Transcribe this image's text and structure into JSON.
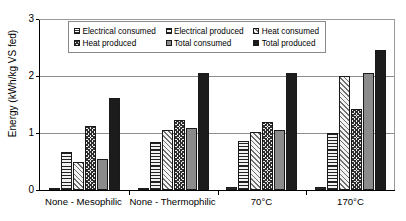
{
  "chart_data": {
    "type": "bar",
    "title": "",
    "xlabel": "",
    "ylabel": "Energy (kWh/kg VS fed)",
    "ylim": [
      0,
      3
    ],
    "yticks": [
      0,
      1,
      2,
      3
    ],
    "ytick_labels": [
      "0",
      "1",
      "2",
      "3"
    ],
    "grid": "horizontal",
    "legend_position": "top-center-inside",
    "categories": [
      "None - Mesophilic",
      "None - Thermophilic",
      "70°C",
      "170°C"
    ],
    "series": [
      {
        "name": "Electrical consumed",
        "fill": "cross-hatch-fine",
        "values": [
          0.04,
          0.04,
          0.05,
          0.06
        ]
      },
      {
        "name": "Electrical produced",
        "fill": "horizontal-lines",
        "values": [
          0.66,
          0.85,
          0.86,
          1.0
        ]
      },
      {
        "name": "Heat consumed",
        "fill": "diagonal-lines",
        "values": [
          0.5,
          1.05,
          1.01,
          2.0
        ]
      },
      {
        "name": "Heat produced",
        "fill": "dense-cross-hatch",
        "values": [
          1.12,
          1.22,
          1.2,
          1.43
        ]
      },
      {
        "name": "Total consumed",
        "fill": "solid-gray",
        "values": [
          0.54,
          1.09,
          1.06,
          2.06
        ]
      },
      {
        "name": "Total produced",
        "fill": "solid-black",
        "values": [
          1.62,
          2.05,
          2.05,
          2.46
        ]
      }
    ]
  },
  "colors": {
    "axis": "#000000",
    "gridline": "#8d8d8d",
    "total_consumed": "#8b8b8b",
    "total_produced": "#1c1c1c",
    "background": "#ffffff"
  }
}
